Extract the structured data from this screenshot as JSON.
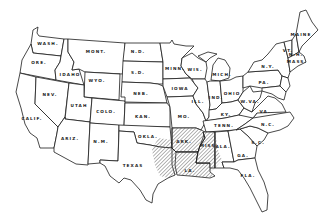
{
  "map": {
    "title": "",
    "style": "black-and-white outline map of contiguous United States",
    "colors": {
      "background": "#ffffff",
      "outline": "#1a1a1a",
      "hatch": "#555555"
    },
    "highlighted_region": {
      "pattern": "diagonal-hatch",
      "states": [
        "TEXAS (east)",
        "OKLA. (southeast)",
        "ARK.",
        "LA.",
        "MISS."
      ]
    },
    "labels": {
      "wash": "WASH.",
      "ore": "ORE.",
      "calif": "CALIF.",
      "idaho": "IDAHO",
      "nev": "NEV.",
      "mont": "MONT.",
      "wyo": "WYO.",
      "utah": "UTAH",
      "ariz": "ARIZ.",
      "colo": "COLO.",
      "nm": "N.M.",
      "nd": "N.D.",
      "sd": "S.D.",
      "neb": "NEB.",
      "kan": "KAN.",
      "okla": "OKLA.",
      "texas": "TEXAS",
      "minn": "MINN.",
      "iowa": "IOWA",
      "mo": "MO.",
      "ark": "ARK.",
      "la": "LA.",
      "wis": "WIS.",
      "ill": "ILL.",
      "mich": "MICH.",
      "ind": "IND.",
      "ohio": "OHIO",
      "ky": "KY.",
      "tenn": "TENN.",
      "miss": "MISS.",
      "ala": "ALA.",
      "ga": "GA.",
      "fla": "FLA.",
      "sc": "S.C.",
      "nc": "N.C.",
      "va": "VA.",
      "wva": "W.VA.",
      "pa": "PA.",
      "ny": "N.Y.",
      "vt": "VT.",
      "nh": "N.H.",
      "maine": "MAINE",
      "mass": "MASS."
    }
  }
}
